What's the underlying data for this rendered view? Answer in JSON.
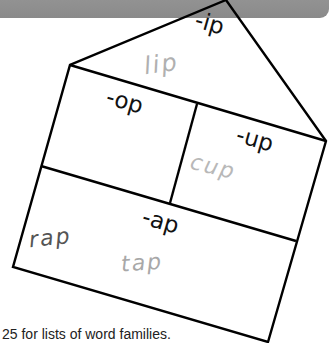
{
  "banner": {
    "color": "#8f8f8f"
  },
  "house": {
    "stroke_color": "#000000",
    "roof": {
      "label": "-ip",
      "example_words": [
        "lip"
      ]
    },
    "rooms": [
      {
        "label": "-op",
        "example_words": []
      },
      {
        "label": "-up",
        "example_words": [
          "cup"
        ]
      },
      {
        "label": "-ap",
        "example_words": [
          "rap",
          "tap"
        ]
      }
    ]
  },
  "words": {
    "lip": {
      "text": "lip",
      "color": "#b0b0b0"
    },
    "cup": {
      "text": "cup",
      "color": "#b8b8b8"
    },
    "rap": {
      "text": "rap",
      "color": "#555555"
    },
    "tap": {
      "text": "tap",
      "color": "#a8a8a8"
    }
  },
  "caption": "25 for lists of word families."
}
